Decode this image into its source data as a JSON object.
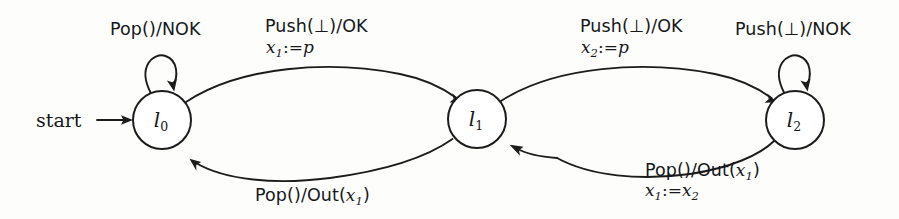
{
  "diagram": {
    "kind": "finite-state-automaton",
    "title": "",
    "start_label": "start",
    "ink_color": "#1c1c1c",
    "background_color": "#fdfdfc",
    "states": [
      {
        "id": "l0",
        "name": "l",
        "subscript": "0",
        "cx": 162,
        "cy": 120,
        "r": 29,
        "initial": true
      },
      {
        "id": "l1",
        "name": "l",
        "subscript": "1",
        "cx": 477,
        "cy": 119,
        "r": 29,
        "initial": false
      },
      {
        "id": "l2",
        "name": "l",
        "subscript": "2",
        "cx": 795,
        "cy": 120,
        "r": 29,
        "initial": false
      }
    ],
    "transitions": [
      {
        "id": "t-l0-self",
        "from": "l0",
        "to": "l0",
        "kind": "self-loop",
        "action": "Pop()/NOK",
        "assignment": ""
      },
      {
        "id": "t-l0-l1",
        "from": "l0",
        "to": "l1",
        "kind": "arc-top",
        "action": "Push(⊥)/OK",
        "assignment_var": "x",
        "assignment_sub": "1",
        "assignment_op": ":=",
        "assignment_val": "p"
      },
      {
        "id": "t-l1-l2",
        "from": "l1",
        "to": "l2",
        "kind": "arc-top",
        "action": "Push(⊥)/OK",
        "assignment_var": "x",
        "assignment_sub": "2",
        "assignment_op": ":=",
        "assignment_val": "p"
      },
      {
        "id": "t-l2-self",
        "from": "l2",
        "to": "l2",
        "kind": "self-loop",
        "action": "Push(⊥)/NOK",
        "assignment": ""
      },
      {
        "id": "t-l1-l0",
        "from": "l1",
        "to": "l0",
        "kind": "arc-bottom",
        "action_pre": "Pop()/Out(",
        "action_var": "x",
        "action_sub": "1",
        "action_post": ")",
        "assignment": ""
      },
      {
        "id": "t-l2-l1",
        "from": "l2",
        "to": "l1",
        "kind": "arc-bottom",
        "action_pre": "Pop()/Out(",
        "action_var": "x",
        "action_sub": "1",
        "action_post": ")",
        "assignment_var": "x",
        "assignment_sub": "1",
        "assignment_op": ":=",
        "assignment_val": "x",
        "assignment_val_sub": "2"
      }
    ],
    "labels": {
      "pop_nok": "Pop()/NOK",
      "push_ok_1": "Push(⊥)/OK",
      "push_ok_2": "Push(⊥)/OK",
      "push_nok": "Push(⊥)/NOK",
      "pop_out_pre": "Pop()/Out(",
      "pop_out_post": ")",
      "var_x": "x",
      "sub_1": "1",
      "sub_2": "2",
      "assign_op": ":=",
      "val_p": "p"
    }
  }
}
